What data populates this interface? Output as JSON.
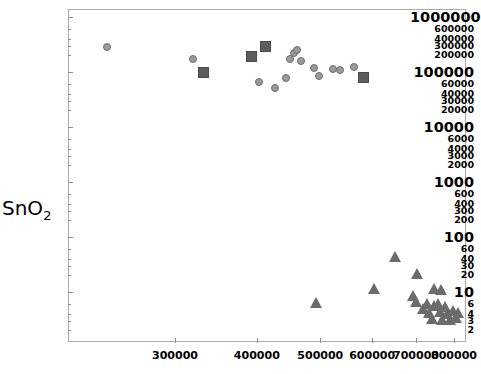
{
  "chart_data": {
    "type": "scatter",
    "title": "",
    "xlabel": "",
    "ylabel": "SnO2",
    "ylabel_base": "SnO",
    "ylabel_sub": "2",
    "xscale": "log",
    "yscale": "log",
    "grid": false,
    "legend": "none",
    "xlim": [
      220000,
      860000
    ],
    "ylim": [
      2,
      1000000
    ],
    "xticks": [
      300000,
      400000,
      500000,
      600000,
      700000,
      800000
    ],
    "xtick_labels": [
      "300000",
      "400000",
      "500000",
      "600000",
      "700000",
      "800000"
    ],
    "yticks": [
      2,
      3,
      4,
      6,
      10,
      20,
      30,
      40,
      60,
      100,
      200,
      300,
      400,
      600,
      1000,
      2000,
      3000,
      4000,
      6000,
      10000,
      20000,
      30000,
      40000,
      60000,
      100000,
      200000,
      300000,
      400000,
      600000,
      1000000
    ],
    "ytick_labels": [
      "2",
      "3",
      "4",
      "6",
      "10",
      "20",
      "30",
      "40",
      "60",
      "100",
      "200",
      "300",
      "400",
      "600",
      "1000",
      "2000",
      "3000",
      "4000",
      "6000",
      "10000",
      "20000",
      "30000",
      "40000",
      "60000",
      "100000",
      "200000",
      "300000",
      "400000",
      "600000",
      "1000000"
    ],
    "ytick_major": [
      "10",
      "100",
      "1000",
      "10000",
      "100000",
      "1000000"
    ],
    "colors": {
      "circle": "#9a9a9a",
      "circle_edge": "#6f6f6f",
      "square": "#5d5d5d",
      "triangle": "#6b6b6b",
      "axis": "#aaaaaa",
      "text": "#000000",
      "background": "#ffffff"
    },
    "series": [
      {
        "name": "circles",
        "marker": "circle",
        "points": [
          [
            236000,
            280000
          ],
          [
            320000,
            170000
          ],
          [
            392000,
            195000
          ],
          [
            403000,
            67000
          ],
          [
            456000,
            220000
          ],
          [
            461000,
            250000
          ],
          [
            450000,
            175000
          ],
          [
            468000,
            160000
          ],
          [
            443000,
            78000
          ],
          [
            427000,
            52000
          ],
          [
            489000,
            120000
          ],
          [
            497000,
            86000
          ],
          [
            522000,
            115000
          ],
          [
            536000,
            110000
          ],
          [
            562000,
            125000
          ]
        ]
      },
      {
        "name": "squares",
        "marker": "square",
        "points": [
          [
            332000,
            96000
          ],
          [
            392000,
            195000
          ],
          [
            413000,
            295000
          ],
          [
            583000,
            78000
          ]
        ]
      },
      {
        "name": "triangles",
        "marker": "triangle",
        "points": [
          [
            493000,
            6.5
          ],
          [
            604000,
            11.5
          ],
          [
            652000,
            44
          ],
          [
            703000,
            22
          ],
          [
            694000,
            8.5
          ],
          [
            700000,
            6.8
          ],
          [
            718000,
            5.0
          ],
          [
            730000,
            6.2
          ],
          [
            734000,
            4.3
          ],
          [
            741000,
            3.3
          ],
          [
            748000,
            5.6
          ],
          [
            757000,
            6.3
          ],
          [
            763000,
            4.4
          ],
          [
            767000,
            3.1
          ],
          [
            776000,
            5.5
          ],
          [
            783000,
            4.0
          ],
          [
            791000,
            3.2
          ],
          [
            798000,
            4.6
          ],
          [
            806000,
            3.4
          ],
          [
            812000,
            4.2
          ],
          [
            748000,
            11.5
          ],
          [
            766000,
            11.0
          ]
        ]
      }
    ]
  }
}
